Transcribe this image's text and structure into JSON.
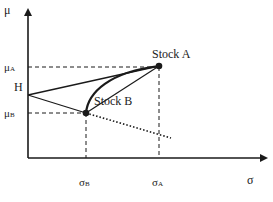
{
  "diagram": {
    "type": "mean-standard-deviation frontier",
    "axes": {
      "y_label": "μ",
      "x_label": "σ"
    },
    "points": {
      "stock_a": {
        "label": "Stock A",
        "mu_label": "μA",
        "sigma_label": "σA"
      },
      "stock_b": {
        "label": "Stock B",
        "mu_label": "μB",
        "sigma_label": "σB"
      },
      "h": {
        "label": "H"
      }
    },
    "colors": {
      "line": "#1a1a1a",
      "background": "#ffffff"
    }
  }
}
